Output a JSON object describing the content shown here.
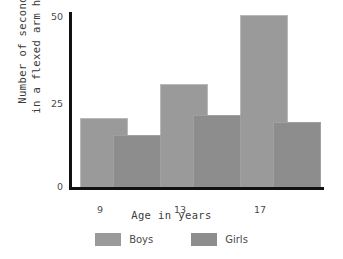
{
  "chart_data": {
    "type": "bar",
    "title": "",
    "categories": [
      "9",
      "13",
      "17"
    ],
    "series": [
      {
        "name": "Boys",
        "values": [
          20,
          30,
          50
        ],
        "color": "#9a9a9a"
      },
      {
        "name": "Girls",
        "values": [
          15,
          21,
          19
        ],
        "color": "#8d8d8d"
      }
    ],
    "xlabel": "Age in years",
    "ylabel_line1": "Number of seconds",
    "ylabel_line2": "in a flexed arm hang",
    "ylim": [
      0,
      50
    ],
    "yticks": [
      "0",
      "25",
      "50"
    ],
    "grid": false,
    "legend_position": "bottom"
  },
  "axis": {
    "y": {
      "tick_50": "50",
      "tick_25": "25",
      "tick_0": "0",
      "title_line1": "Number of seconds",
      "title_line2": "in a flexed arm hang"
    },
    "x": {
      "tick_0": "9",
      "tick_1": "13",
      "tick_2": "17",
      "title": "Age in years"
    }
  },
  "legend": {
    "items": [
      {
        "label": "Boys",
        "color": "#9a9a9a"
      },
      {
        "label": "Girls",
        "color": "#8d8d8d"
      }
    ]
  }
}
